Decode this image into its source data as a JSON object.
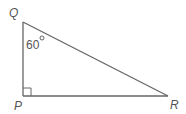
{
  "diagram": {
    "type": "right-triangle",
    "vertices": {
      "Q": {
        "label": "Q",
        "x": 23,
        "y": 22
      },
      "P": {
        "label": "P",
        "x": 23,
        "y": 96
      },
      "R": {
        "label": "R",
        "x": 168,
        "y": 96
      }
    },
    "angle_Q": {
      "value": "60",
      "unit": "°"
    },
    "right_angle_at": "P",
    "line_color": "#666666",
    "text_color": "#555555"
  }
}
